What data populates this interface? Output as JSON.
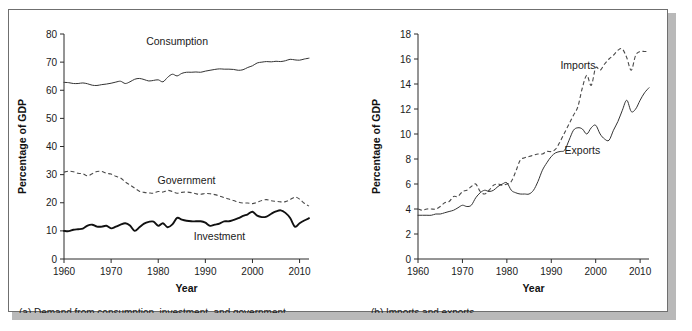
{
  "figure": {
    "panel_a_caption": "(a) Demand from consumption, investment, and government",
    "panel_b_caption": "(b) Imports and exports"
  },
  "chart_data": [
    {
      "type": "line",
      "panel": "a",
      "title": "",
      "caption": "(a) Demand from consumption, investment, and government",
      "xlabel": "Year",
      "ylabel": "Percentage of GDP",
      "xlim": [
        1960,
        2012
      ],
      "ylim": [
        0,
        80
      ],
      "xticks": [
        1960,
        1970,
        1980,
        1990,
        2000,
        2010
      ],
      "yticks": [
        0,
        10,
        20,
        30,
        40,
        50,
        60,
        70,
        80
      ],
      "grid": false,
      "legend_position": "inline-annotations",
      "x": [
        1960,
        1961,
        1962,
        1963,
        1964,
        1965,
        1966,
        1967,
        1968,
        1969,
        1970,
        1971,
        1972,
        1973,
        1974,
        1975,
        1976,
        1977,
        1978,
        1979,
        1980,
        1981,
        1982,
        1983,
        1984,
        1985,
        1986,
        1987,
        1988,
        1989,
        1990,
        1991,
        1992,
        1993,
        1994,
        1995,
        1996,
        1997,
        1998,
        1999,
        2000,
        2001,
        2002,
        2003,
        2004,
        2005,
        2006,
        2007,
        2008,
        2009,
        2010,
        2011,
        2012
      ],
      "series": [
        {
          "name": "Consumption",
          "style": "solid-thin",
          "label_x": 1984,
          "label_y": 76,
          "values": [
            62.8,
            62.7,
            62.4,
            62.4,
            62.6,
            62.3,
            61.8,
            61.7,
            62.0,
            62.2,
            62.5,
            62.9,
            63.2,
            62.4,
            63.0,
            63.9,
            64.2,
            63.8,
            63.3,
            63.5,
            63.7,
            63.0,
            64.6,
            65.7,
            65.1,
            66.0,
            66.4,
            66.4,
            66.5,
            66.4,
            66.8,
            67.1,
            67.4,
            67.6,
            67.5,
            67.5,
            67.4,
            67.1,
            67.3,
            68.1,
            68.7,
            69.7,
            70.0,
            70.2,
            70.1,
            70.3,
            70.2,
            70.5,
            71.0,
            70.8,
            70.7,
            71.1,
            71.4
          ]
        },
        {
          "name": "Government",
          "style": "dashed",
          "label_x": 1986,
          "label_y": 26.5,
          "values": [
            30.9,
            31.2,
            31.0,
            30.5,
            30.3,
            29.6,
            30.3,
            31.1,
            31.1,
            30.5,
            30.2,
            29.4,
            28.8,
            27.4,
            26.3,
            25.2,
            24.1,
            23.7,
            23.5,
            23.4,
            24.0,
            23.8,
            24.4,
            24.0,
            23.4,
            23.7,
            23.8,
            23.6,
            23.2,
            23.0,
            23.3,
            23.2,
            22.9,
            22.4,
            21.8,
            21.3,
            20.8,
            20.2,
            19.9,
            19.9,
            19.7,
            20.2,
            20.8,
            21.1,
            20.7,
            20.5,
            20.3,
            20.4,
            21.1,
            22.0,
            21.3,
            19.8,
            18.8
          ]
        },
        {
          "name": "Investment",
          "style": "solid-thick",
          "label_x": 1993,
          "label_y": 6.8,
          "values": [
            10.0,
            9.9,
            10.4,
            10.6,
            10.8,
            11.9,
            12.2,
            11.5,
            11.5,
            11.8,
            10.9,
            11.5,
            12.2,
            12.7,
            11.9,
            10.0,
            11.3,
            12.6,
            13.2,
            13.3,
            11.8,
            12.7,
            11.3,
            12.3,
            14.6,
            14.0,
            13.6,
            13.4,
            13.4,
            13.4,
            12.9,
            11.8,
            12.2,
            12.6,
            13.4,
            13.4,
            13.9,
            14.5,
            15.3,
            15.9,
            16.8,
            15.4,
            14.9,
            15.1,
            16.1,
            16.9,
            17.3,
            16.4,
            14.6,
            11.5,
            12.7,
            13.7,
            14.5
          ]
        }
      ]
    },
    {
      "type": "line",
      "panel": "b",
      "title": "",
      "caption": "(b) Imports and exports",
      "xlabel": "Year",
      "ylabel": "Percentage of GDP",
      "xlim": [
        1960,
        2012
      ],
      "ylim": [
        0,
        18
      ],
      "xticks": [
        1960,
        1970,
        1980,
        1990,
        2000,
        2010
      ],
      "yticks": [
        0,
        2,
        4,
        6,
        8,
        10,
        12,
        14,
        16,
        18
      ],
      "grid": false,
      "legend_position": "inline-annotations",
      "x": [
        1960,
        1961,
        1962,
        1963,
        1964,
        1965,
        1966,
        1967,
        1968,
        1969,
        1970,
        1971,
        1972,
        1973,
        1974,
        1975,
        1976,
        1977,
        1978,
        1979,
        1980,
        1981,
        1982,
        1983,
        1984,
        1985,
        1986,
        1987,
        1988,
        1989,
        1990,
        1991,
        1992,
        1993,
        1994,
        1995,
        1996,
        1997,
        1998,
        1999,
        2000,
        2001,
        2002,
        2003,
        2004,
        2005,
        2006,
        2007,
        2008,
        2009,
        2010,
        2011,
        2012
      ],
      "series": [
        {
          "name": "Imports",
          "style": "dashed",
          "label_x": 1996,
          "label_y": 15.2,
          "values": [
            4.0,
            3.9,
            4.0,
            4.0,
            4.0,
            4.2,
            4.5,
            4.6,
            5.0,
            5.0,
            5.4,
            5.5,
            5.8,
            6.0,
            5.4,
            5.2,
            5.5,
            5.9,
            6.0,
            5.9,
            6.0,
            6.2,
            7.0,
            7.9,
            8.1,
            8.2,
            8.3,
            8.4,
            8.4,
            8.6,
            8.6,
            8.8,
            9.4,
            10.1,
            10.8,
            11.5,
            12.2,
            13.7,
            14.7,
            13.9,
            15.3,
            15.1,
            15.6,
            16.0,
            16.3,
            16.7,
            16.8,
            16.1,
            15.1,
            16.3,
            16.6,
            16.6,
            16.6
          ]
        },
        {
          "name": "Exports",
          "style": "solid-thin",
          "label_x": 1997,
          "label_y": 8.4,
          "values": [
            3.5,
            3.5,
            3.5,
            3.5,
            3.6,
            3.6,
            3.7,
            3.8,
            3.9,
            4.1,
            4.3,
            4.2,
            4.3,
            4.9,
            5.3,
            5.5,
            5.4,
            5.5,
            5.8,
            6.0,
            6.1,
            5.5,
            5.3,
            5.2,
            5.2,
            5.2,
            5.5,
            6.2,
            7.1,
            7.7,
            8.2,
            8.5,
            8.6,
            8.7,
            9.5,
            10.3,
            10.5,
            10.4,
            10.0,
            10.5,
            10.7,
            10.0,
            9.6,
            9.5,
            10.3,
            11.0,
            11.9,
            12.7,
            11.8,
            12.0,
            12.7,
            13.3,
            13.7
          ]
        }
      ]
    }
  ]
}
